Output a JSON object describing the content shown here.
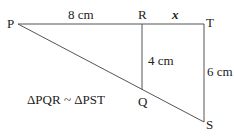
{
  "diagram": {
    "points": {
      "P": {
        "label": "P",
        "x": 18,
        "y": 24
      },
      "R": {
        "label": "R",
        "x": 142,
        "y": 24
      },
      "T": {
        "label": "T",
        "x": 204,
        "y": 24
      },
      "Q": {
        "label": "Q",
        "x": 142,
        "y": 90
      },
      "S": {
        "label": "S",
        "x": 204,
        "y": 122
      }
    },
    "measurements": {
      "PR": "8 cm",
      "RT": "x",
      "RQ": "4 cm",
      "TS": "6 cm"
    },
    "relation": "ΔPQR ~ ΔPST",
    "line_color": "#555555"
  }
}
